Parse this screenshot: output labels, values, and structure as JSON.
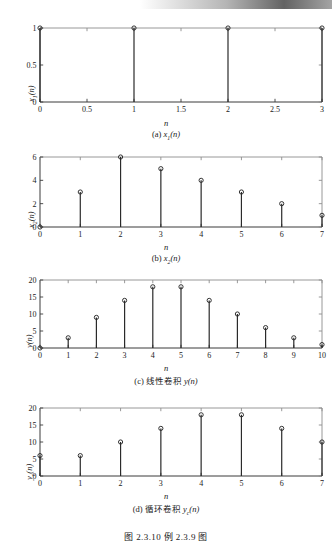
{
  "header": {
    "bar_text": ""
  },
  "figure": {
    "caption": "图 2.3.10   例 2.3.9 图"
  },
  "panels": [
    {
      "id": "panel-a",
      "caption": "(a) x1(n)",
      "caption_prefix": "(a)",
      "ylabel": "x1(n)",
      "xlabel": "n"
    },
    {
      "id": "panel-b",
      "caption": "(b) x2(n)",
      "caption_prefix": "(b)",
      "ylabel": "x2(n)",
      "xlabel": "n"
    },
    {
      "id": "panel-c",
      "caption": "(c) 线性卷积 y(n)",
      "caption_prefix": "(c)",
      "caption_cn": "线性卷积",
      "ylabel": "y(n)",
      "xlabel": "n"
    },
    {
      "id": "panel-d",
      "caption": "(d) 循环卷积 yc(n)",
      "caption_prefix": "(d)",
      "caption_cn": "循环卷积",
      "ylabel": "yc(n)",
      "xlabel": "n"
    }
  ],
  "chart_data": [
    {
      "type": "stem",
      "id": "x1",
      "title": "(a) x1(n)",
      "xlabel": "n",
      "ylabel": "x1(n)",
      "x": [
        0,
        1,
        2,
        3
      ],
      "values": [
        1,
        1,
        1,
        1
      ],
      "xlim": [
        0,
        3
      ],
      "ylim": [
        0,
        1
      ],
      "xticks": [
        0,
        0.5,
        1,
        1.5,
        2,
        2.5,
        3
      ],
      "xticklabels": [
        "0",
        "0.5",
        "1",
        "1.5",
        "2",
        "2.5",
        "3"
      ],
      "yticks": [
        0,
        0.5,
        1
      ],
      "yticklabels": [
        "0",
        "0.5",
        "1"
      ],
      "grid": false,
      "legend": null,
      "marker": "circle"
    },
    {
      "type": "stem",
      "id": "x2",
      "title": "(b) x2(n)",
      "xlabel": "n",
      "ylabel": "x2(n)",
      "x": [
        0,
        1,
        2,
        3,
        4,
        5,
        6,
        7
      ],
      "values": [
        0,
        3,
        6,
        5,
        4,
        3,
        2,
        1
      ],
      "xlim": [
        0,
        7
      ],
      "ylim": [
        0,
        6
      ],
      "xticks": [
        0,
        1,
        2,
        3,
        4,
        5,
        6,
        7
      ],
      "xticklabels": [
        "0",
        "1",
        "2",
        "3",
        "4",
        "5",
        "6",
        "7"
      ],
      "yticks": [
        0,
        2,
        4,
        6
      ],
      "yticklabels": [
        "0",
        "2",
        "4",
        "6"
      ],
      "grid": false,
      "legend": null,
      "marker": "circle"
    },
    {
      "type": "stem",
      "id": "y-linear",
      "title": "(c) 线性卷积 y(n)",
      "xlabel": "n",
      "ylabel": "y(n)",
      "x": [
        0,
        1,
        2,
        3,
        4,
        5,
        6,
        7,
        8,
        9,
        10
      ],
      "values": [
        0,
        3,
        9,
        14,
        18,
        18,
        14,
        10,
        6,
        3,
        1
      ],
      "xlim": [
        0,
        10
      ],
      "ylim": [
        0,
        20
      ],
      "xticks": [
        0,
        1,
        2,
        3,
        4,
        5,
        6,
        7,
        8,
        9,
        10
      ],
      "xticklabels": [
        "0",
        "1",
        "2",
        "3",
        "4",
        "5",
        "6",
        "7",
        "8",
        "9",
        "10"
      ],
      "yticks": [
        0,
        5,
        10,
        15,
        20
      ],
      "yticklabels": [
        "0",
        "5",
        "10",
        "15",
        "20"
      ],
      "grid": false,
      "legend": null,
      "marker": "circle"
    },
    {
      "type": "stem",
      "id": "y-circular",
      "title": "(d) 循环卷积 yc(n)",
      "xlabel": "n",
      "ylabel": "yc(n)",
      "x": [
        0,
        1,
        2,
        3,
        4,
        5,
        6,
        7
      ],
      "values": [
        6,
        6,
        10,
        14,
        18,
        18,
        14,
        10
      ],
      "xlim": [
        0,
        7
      ],
      "ylim": [
        0,
        20
      ],
      "xticks": [
        0,
        1,
        2,
        3,
        4,
        5,
        6,
        7
      ],
      "xticklabels": [
        "0",
        "1",
        "2",
        "3",
        "4",
        "5",
        "6",
        "7"
      ],
      "yticks": [
        0,
        5,
        10,
        15,
        20
      ],
      "yticklabels": [
        "0",
        "5",
        "10",
        "15",
        "20"
      ],
      "grid": false,
      "legend": null,
      "marker": "circle"
    }
  ]
}
